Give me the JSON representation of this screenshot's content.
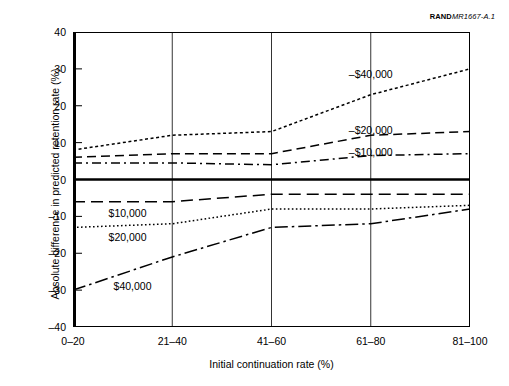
{
  "figure": {
    "source_note_bold": "RAND",
    "source_note_italic": "MR1667-A.1"
  },
  "chart_data": {
    "type": "line",
    "title": "",
    "xlabel": "Initial continuation rate (%)",
    "ylabel": "Absolute difference in predicted retention rate (%)",
    "categories": [
      "0–20",
      "21–40",
      "41–60",
      "61–80",
      "81–100"
    ],
    "ylim": [
      -40,
      40
    ],
    "yticks": [
      40,
      30,
      20,
      10,
      0,
      -10,
      -20,
      -30,
      -40
    ],
    "ytick_labels": [
      "40",
      "30",
      "20",
      "10",
      "0",
      "–10",
      "–20",
      "–30",
      "–40"
    ],
    "grid": "vertical",
    "legend_position": "inline-labels",
    "zero_line": 0,
    "series": [
      {
        "name": "–$40,000",
        "style": "dotted",
        "values": [
          8,
          12,
          13,
          23,
          30
        ],
        "label_x_category": 3,
        "label_value": 28.5
      },
      {
        "name": "–$20,000",
        "style": "dashed",
        "values": [
          6,
          7,
          7,
          12,
          13
        ],
        "label_x_category": 3,
        "label_value": 13.5
      },
      {
        "name": "–$10,000",
        "style": "dash-dot",
        "values": [
          4.5,
          4.5,
          4,
          6.5,
          7
        ],
        "label_x_category": 3,
        "label_value": 7.5
      },
      {
        "name": "$10,000",
        "style": "long-dash",
        "values": [
          -6,
          -6,
          -4,
          -4,
          -4
        ],
        "label_x_category": 0.55,
        "label_value": -9
      },
      {
        "name": "$20,000",
        "style": "fine-dotted",
        "values": [
          -13,
          -12,
          -8,
          -8,
          -7
        ],
        "label_x_category": 0.55,
        "label_value": -15.5
      },
      {
        "name": "$40,000",
        "style": "dash-dot-long",
        "values": [
          -30,
          -21,
          -13,
          -12,
          -8
        ],
        "label_x_category": 0.6,
        "label_value": -29
      }
    ]
  }
}
